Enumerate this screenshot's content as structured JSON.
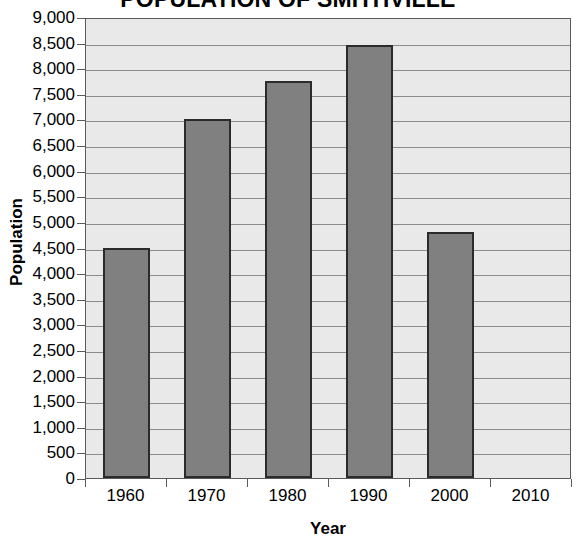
{
  "chart_data": {
    "type": "bar",
    "title": "POPULATION OF SMITHVILLE",
    "xlabel": "Year",
    "ylabel": "Population",
    "categories": [
      "1960",
      "1970",
      "1980",
      "1990",
      "2000",
      "2010"
    ],
    "values": [
      4500,
      7000,
      7750,
      8450,
      4800,
      null
    ],
    "ylim": [
      0,
      9000
    ],
    "ytick_step": 500,
    "ytick_labels": [
      "9,000",
      "8,500",
      "8,000",
      "7,500",
      "7,000",
      "6,500",
      "6,000",
      "5,500",
      "5,000",
      "4,500",
      "4,000",
      "3,500",
      "3,000",
      "2,500",
      "2,000",
      "1,500",
      "1,000",
      "500",
      "0"
    ],
    "ytick_values": [
      9000,
      8500,
      8000,
      7500,
      7000,
      6500,
      6000,
      5500,
      5000,
      4500,
      4000,
      3500,
      3000,
      2500,
      2000,
      1500,
      1000,
      500,
      0
    ],
    "grid": true,
    "legend": null,
    "legend_position": "none",
    "colors": {
      "bar_fill": "#808080",
      "bar_border": "#2b2b2b",
      "plot_background": "#e9e9e9",
      "gridline": "#8c8c8c",
      "axis": "#5a5a5a",
      "text": "#000000",
      "page_background": "#ffffff"
    }
  }
}
